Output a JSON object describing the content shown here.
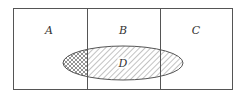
{
  "diagram": {
    "type": "set-partition",
    "regions": [
      {
        "id": "A",
        "label": "A"
      },
      {
        "id": "B",
        "label": "B"
      },
      {
        "id": "C",
        "label": "C"
      }
    ],
    "ellipse": {
      "id": "D",
      "label": "D"
    },
    "colors": {
      "stroke": "#555555",
      "hatch": "#666666",
      "background": "#ffffff"
    }
  }
}
